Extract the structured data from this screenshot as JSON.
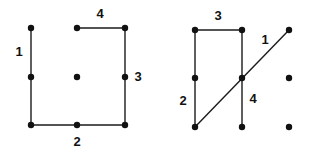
{
  "figures": [
    {
      "name": "left-figure",
      "dots": [
        {
          "x": 31,
          "y": 28
        },
        {
          "x": 77,
          "y": 28
        },
        {
          "x": 125,
          "y": 28
        },
        {
          "x": 31,
          "y": 77
        },
        {
          "x": 77,
          "y": 77
        },
        {
          "x": 125,
          "y": 77
        },
        {
          "x": 31,
          "y": 125
        },
        {
          "x": 77,
          "y": 125
        },
        {
          "x": 125,
          "y": 125
        }
      ],
      "lines": [
        {
          "label": "1",
          "x1": 31,
          "y1": 28,
          "x2": 31,
          "y2": 125,
          "lx": 19,
          "ly": 53
        },
        {
          "label": "2",
          "x1": 31,
          "y1": 125,
          "x2": 125,
          "y2": 125,
          "lx": 77,
          "ly": 143
        },
        {
          "label": "3",
          "x1": 125,
          "y1": 28,
          "x2": 125,
          "y2": 125,
          "lx": 138,
          "ly": 78
        },
        {
          "label": "4",
          "x1": 77,
          "y1": 28,
          "x2": 125,
          "y2": 28,
          "lx": 100,
          "ly": 15
        }
      ]
    },
    {
      "name": "right-figure",
      "dots": [
        {
          "x": 195,
          "y": 30
        },
        {
          "x": 242,
          "y": 30
        },
        {
          "x": 289,
          "y": 30
        },
        {
          "x": 195,
          "y": 78
        },
        {
          "x": 242,
          "y": 78
        },
        {
          "x": 289,
          "y": 78
        },
        {
          "x": 195,
          "y": 127
        },
        {
          "x": 242,
          "y": 127
        },
        {
          "x": 289,
          "y": 127
        }
      ],
      "lines": [
        {
          "label": "1",
          "x1": 289,
          "y1": 30,
          "x2": 195,
          "y2": 127,
          "lx": 265,
          "ly": 41
        },
        {
          "label": "2",
          "x1": 195,
          "y1": 30,
          "x2": 195,
          "y2": 127,
          "lx": 183,
          "ly": 102
        },
        {
          "label": "3",
          "x1": 195,
          "y1": 30,
          "x2": 242,
          "y2": 30,
          "lx": 218,
          "ly": 17
        },
        {
          "label": "4",
          "x1": 242,
          "y1": 30,
          "x2": 242,
          "y2": 127,
          "lx": 253,
          "ly": 100
        }
      ]
    }
  ]
}
